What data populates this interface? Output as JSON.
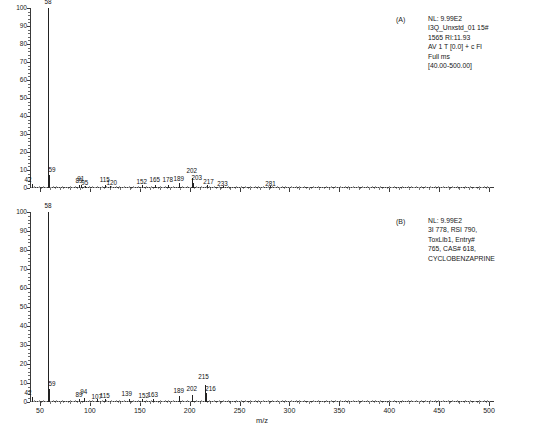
{
  "figure": {
    "yaxis": {
      "label": "Relative Abundance",
      "ticks": [
        0,
        10,
        20,
        30,
        40,
        50,
        60,
        70,
        80,
        90,
        100
      ],
      "min": 0,
      "max": 100
    },
    "xaxis": {
      "title": "m/z",
      "ticks": [
        50,
        100,
        150,
        200,
        250,
        300,
        350,
        400,
        450,
        500
      ],
      "min": 40,
      "max": 505
    }
  },
  "chart_data": [
    {
      "type": "bar",
      "panel": "(A)",
      "title": "Experimental mass spectrum of cyclobenzaprine",
      "xlabel": "m/z",
      "ylabel": "Relative Abundance",
      "xlim": [
        40,
        505
      ],
      "ylim": [
        0,
        100
      ],
      "x": [
        42,
        58,
        59,
        89,
        91,
        95,
        115,
        120,
        152,
        165,
        178,
        189,
        202,
        203,
        217,
        233,
        281
      ],
      "values": [
        2.2,
        100,
        7.5,
        1.6,
        1.8,
        1.3,
        1.6,
        1.3,
        1.4,
        1.5,
        1.5,
        2.6,
        5.8,
        2.6,
        1.5,
        1.2,
        1.0
      ],
      "labels": [
        "42",
        "58",
        "59",
        "89",
        "91",
        "95",
        "115",
        "120",
        "152",
        "165",
        "178",
        "189",
        "202",
        "203",
        "217",
        "233",
        "281"
      ]
    },
    {
      "type": "bar",
      "panel": "(B)",
      "title": "Library reference spectrum of cyclobenzaprine",
      "xlabel": "m/z",
      "ylabel": "Relative Abundance",
      "xlim": [
        40,
        505
      ],
      "ylim": [
        0,
        100
      ],
      "x": [
        42,
        58,
        59,
        89,
        94,
        115,
        139,
        152,
        163,
        107,
        189,
        202,
        215,
        216
      ],
      "values": [
        2.4,
        100,
        7.0,
        1.7,
        1.9,
        1.5,
        1.6,
        1.8,
        1.6,
        1.5,
        3.0,
        3.6,
        9.0,
        5.0
      ],
      "labels": [
        "42",
        "58",
        "59",
        "89",
        "94",
        "115",
        "139",
        "152",
        "163",
        "107",
        "189",
        "202",
        "215",
        "216"
      ]
    }
  ],
  "panel_a": {
    "tag": "(A)",
    "annotation": "NL: 9.99E2\nI3Q_Unxstd_01 15#\n1565 RI:11.93\nAV 1 T [0.0] + c Fl\nFull ms\n[40.00-500.00]"
  },
  "panel_b": {
    "tag": "(B)",
    "annotation": "NL: 9.99E2\n3I 778, RSI 790,\nToxLib1, Entry#\n765, CAS# 618,\nCYCLOBENZAPRINE"
  }
}
